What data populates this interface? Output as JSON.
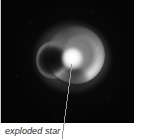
{
  "figure": {
    "width": 147,
    "height": 140,
    "background_color": "#ffffff"
  },
  "image_plate": {
    "name": "astronomical-image",
    "subject": "exploded star",
    "background_color": "#050505",
    "left": 1,
    "top": 0,
    "width": 133,
    "height": 123,
    "description": "Grayscale telescope image of a bright, roughly circular supernova remnant shell with a brilliant central knot, a dark cavity on its left flank and banded striations across its interior, set against a black sky."
  },
  "annotation": {
    "name": "exploded-star-callout",
    "label": "exploded star",
    "leader_line": {
      "color": "#9a9a9a",
      "width": 1,
      "from_x": 72,
      "from_y": 64,
      "to_x": 62,
      "to_y": 139
    }
  },
  "rules": {
    "left_rule_color": "#c9c9c9"
  }
}
